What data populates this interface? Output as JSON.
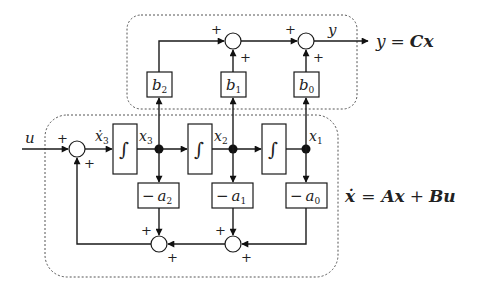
{
  "diagram": {
    "input_label": "u",
    "output_label": "y",
    "output_equation": {
      "lhs": "y",
      "eq": "=",
      "rhs": "Cx"
    },
    "state_equation": {
      "lhs": "ẋ",
      "eq": "=",
      "term1": "Ax",
      "plus": "+",
      "term2": "Bu"
    },
    "integrators": [
      {
        "symbol": "∫",
        "input": "ẋ3",
        "output": "x3"
      },
      {
        "symbol": "∫",
        "input": "",
        "output": "x2"
      },
      {
        "symbol": "∫",
        "input": "",
        "output": "x1"
      }
    ],
    "state_labels": {
      "x3dot": "ẋ",
      "x3dot_sub": "3",
      "x3": "x",
      "x3_sub": "3",
      "x2": "x",
      "x2_sub": "2",
      "x1": "x",
      "x1_sub": "1"
    },
    "output_gains": [
      {
        "base": "b",
        "sub": "2"
      },
      {
        "base": "b",
        "sub": "1"
      },
      {
        "base": "b",
        "sub": "0"
      }
    ],
    "feedback_gains": [
      {
        "minus": "−",
        "base": "a",
        "sub": "2"
      },
      {
        "minus": "−",
        "base": "a",
        "sub": "1"
      },
      {
        "minus": "−",
        "base": "a",
        "sub": "0"
      }
    ],
    "sign": "+"
  }
}
